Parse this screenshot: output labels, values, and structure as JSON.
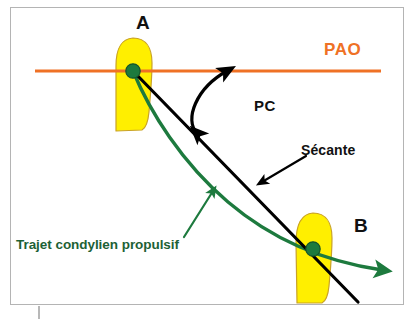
{
  "figure": {
    "title": "Trajet condylien propulsif",
    "background_color": "#ffffff",
    "frame_border_color": "#b4b4b4"
  },
  "labels": {
    "point_a": "A",
    "point_b": "B",
    "pao": "PAO",
    "pc": "PC",
    "secante": "Sécante",
    "trajet": "Trajet condylien propulsif"
  },
  "colors": {
    "orange_line": "#ef7125",
    "orange_text": "#ef7125",
    "green_curve": "#1d7a3e",
    "green_text": "#1d6135",
    "green_marker_fill": "#1d7a3e",
    "green_marker_stroke": "#14532b",
    "condyle_fill": "#ffef00",
    "condyle_stroke": "#c9a227",
    "black_line": "#000000",
    "frame": "#b4b4b4",
    "tick_line": "#9a9a9a"
  },
  "geometry": {
    "pao_line": {
      "x1": 35,
      "y1": 71,
      "x2": 381,
      "y2": 71,
      "width": 3
    },
    "secant_line": {
      "x1": 133,
      "y1": 71,
      "x2": 358,
      "y2": 302,
      "width": 3
    },
    "condyle_a": {
      "cx": 133,
      "cy": 71,
      "top": 38,
      "bottom": 131,
      "width": 46
    },
    "condyle_b": {
      "cx": 313,
      "cy": 249,
      "top": 212,
      "bottom": 303,
      "width": 44
    },
    "marker_a": {
      "cx": 133,
      "cy": 71,
      "r": 7
    },
    "marker_b": {
      "cx": 313,
      "cy": 249,
      "r": 7
    },
    "green_curve": {
      "start_x": 133,
      "start_y": 71,
      "end_x": 392,
      "end_y": 272
    },
    "pc_arc": {
      "from_x": 196,
      "from_y": 134,
      "to_x": 228,
      "to_y": 69
    },
    "secante_leader": {
      "from_x": 306,
      "from_y": 156,
      "to_x": 261,
      "to_y": 183
    },
    "trajet_leader": {
      "from_x": 184,
      "from_y": 237,
      "to_x": 213,
      "to_y": 191
    },
    "bottom_tick": {
      "x": 39,
      "y1": 306,
      "y2": 319
    }
  }
}
